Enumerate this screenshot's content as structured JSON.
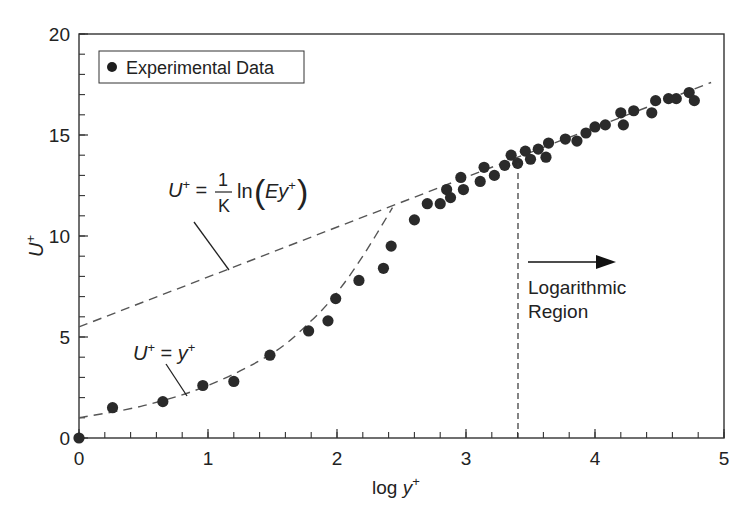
{
  "chart_data": {
    "type": "scatter",
    "title": "",
    "xlabel": "log y+",
    "ylabel": "U+",
    "xlim": [
      0,
      5
    ],
    "ylim": [
      0,
      20
    ],
    "x_ticks": [
      0,
      1,
      2,
      3,
      4,
      5
    ],
    "y_ticks": [
      0,
      5,
      10,
      15,
      20
    ],
    "x_minor_step": 0.2,
    "y_minor_step": 1,
    "grid": false,
    "legend": {
      "position": "upper-left",
      "entries": [
        "Experimental Data"
      ]
    },
    "series": [
      {
        "name": "Experimental Data",
        "kind": "scatter",
        "color": "#2a2a2a",
        "points": [
          [
            0.0,
            0.0
          ],
          [
            0.26,
            1.5
          ],
          [
            0.65,
            1.8
          ],
          [
            0.96,
            2.6
          ],
          [
            1.2,
            2.8
          ],
          [
            1.48,
            4.1
          ],
          [
            1.78,
            5.3
          ],
          [
            1.93,
            5.8
          ],
          [
            1.99,
            6.9
          ],
          [
            2.17,
            7.8
          ],
          [
            2.36,
            8.4
          ],
          [
            2.42,
            9.5
          ],
          [
            2.6,
            10.8
          ],
          [
            2.7,
            11.6
          ],
          [
            2.8,
            11.6
          ],
          [
            2.85,
            12.3
          ],
          [
            2.88,
            11.9
          ],
          [
            2.96,
            12.9
          ],
          [
            2.98,
            12.3
          ],
          [
            3.11,
            12.7
          ],
          [
            3.14,
            13.4
          ],
          [
            3.22,
            13.0
          ],
          [
            3.3,
            13.5
          ],
          [
            3.35,
            14.0
          ],
          [
            3.4,
            13.6
          ],
          [
            3.46,
            14.2
          ],
          [
            3.5,
            13.8
          ],
          [
            3.56,
            14.3
          ],
          [
            3.62,
            13.9
          ],
          [
            3.64,
            14.6
          ],
          [
            3.77,
            14.8
          ],
          [
            3.86,
            14.7
          ],
          [
            3.93,
            15.1
          ],
          [
            4.0,
            15.4
          ],
          [
            4.08,
            15.5
          ],
          [
            4.2,
            16.1
          ],
          [
            4.22,
            15.5
          ],
          [
            4.3,
            16.2
          ],
          [
            4.44,
            16.1
          ],
          [
            4.47,
            16.7
          ],
          [
            4.57,
            16.8
          ],
          [
            4.63,
            16.8
          ],
          [
            4.73,
            17.1
          ],
          [
            4.77,
            16.7
          ]
        ]
      },
      {
        "name": "Log law: U+ = (1/K) ln(Ey+)",
        "kind": "line",
        "style": "dashed",
        "color": "#555555",
        "points": [
          [
            0,
            5.5
          ],
          [
            4.9,
            17.6
          ]
        ]
      },
      {
        "name": "Viscous sublayer: U+ = y+",
        "kind": "line",
        "style": "dashed",
        "color": "#555555",
        "points": [
          [
            0,
            1.0
          ],
          [
            0.5,
            1.6
          ],
          [
            1.0,
            2.6
          ],
          [
            1.5,
            4.2
          ],
          [
            1.8,
            5.8
          ],
          [
            2.0,
            7.2
          ],
          [
            2.2,
            9.0
          ],
          [
            2.43,
            11.4
          ]
        ]
      }
    ],
    "annotations": [
      {
        "text": "U+ = (1/K) ln(Ey+)",
        "x": 0.9,
        "y": 12.2,
        "leader_to": [
          1.12,
          8.5
        ]
      },
      {
        "text": "U+ = y+",
        "x": 0.45,
        "y": 4.6,
        "leader_to": [
          0.8,
          2.2
        ]
      },
      {
        "text": "Logarithmic Region",
        "x": 3.5,
        "y": 7.5,
        "arrow": {
          "from": 3.45,
          "to": 4.2,
          "y": 10.3
        }
      },
      {
        "text": "vertical dashed boundary",
        "x": 3.4,
        "y_range": [
          0,
          13.6
        ]
      }
    ]
  },
  "labels": {
    "legend": "Experimental Data",
    "x_axis": {
      "prefix": "log ",
      "var": "y",
      "sup": "+"
    },
    "y_axis": {
      "var": "U",
      "sup": "+"
    },
    "log_law": {
      "lhs": "U",
      "sup": "+",
      "eq": " = ",
      "num": "1",
      "den": "K",
      "fn": "ln",
      "arg_var": "Ey",
      "arg_sup": "+"
    },
    "lin_law": {
      "lhs": "U",
      "sup": "+",
      "eq": " = ",
      "rhs": "y",
      "rhs_sup": "+"
    },
    "region_line1": "Logarithmic",
    "region_line2": "Region",
    "x_tick_labels": [
      "0",
      "1",
      "2",
      "3",
      "4",
      "5"
    ],
    "y_tick_labels": [
      "0",
      "5",
      "10",
      "15",
      "20"
    ]
  }
}
